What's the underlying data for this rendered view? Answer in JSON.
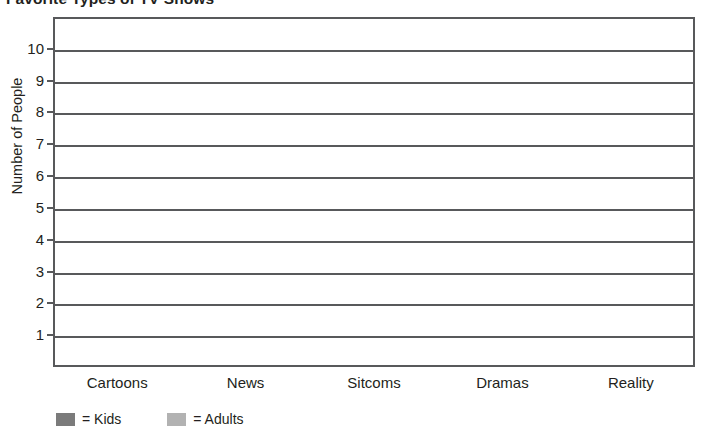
{
  "chart_data": {
    "type": "bar",
    "title": "Favorite Types of TV Shows",
    "xlabel": "",
    "ylabel": "Number of People",
    "categories": [
      "Cartoons",
      "News",
      "Sitcoms",
      "Dramas",
      "Reality"
    ],
    "series": [
      {
        "name": "Kids",
        "color": "#7b7b7b",
        "values": [
          null,
          null,
          null,
          null,
          null
        ]
      },
      {
        "name": "Adults",
        "color": "#b2b2b2",
        "values": [
          null,
          null,
          null,
          null,
          null
        ]
      }
    ],
    "ylim": [
      0,
      11
    ],
    "ytick_labels": [
      "10",
      "9",
      "8",
      "7",
      "6",
      "5",
      "4",
      "3",
      "2",
      "1"
    ],
    "ytick_values": [
      10,
      9,
      8,
      7,
      6,
      5,
      4,
      3,
      2,
      1
    ],
    "grid": true,
    "grid_orientation": "horizontal",
    "legend_position": "bottom-left",
    "note": "Empty grid template — no bars are plotted"
  },
  "legend": {
    "entries": [
      {
        "label": "= Kids",
        "color": "#7b7b7b",
        "swatch_name": "kids-swatch"
      },
      {
        "label": "= Adults",
        "color": "#b2b2b2",
        "swatch_name": "adults-swatch"
      }
    ]
  },
  "colors": {
    "axis": "#58595b",
    "text": "#231f20",
    "background": "#ffffff",
    "kids": "#7b7b7b",
    "adults": "#b2b2b2"
  }
}
